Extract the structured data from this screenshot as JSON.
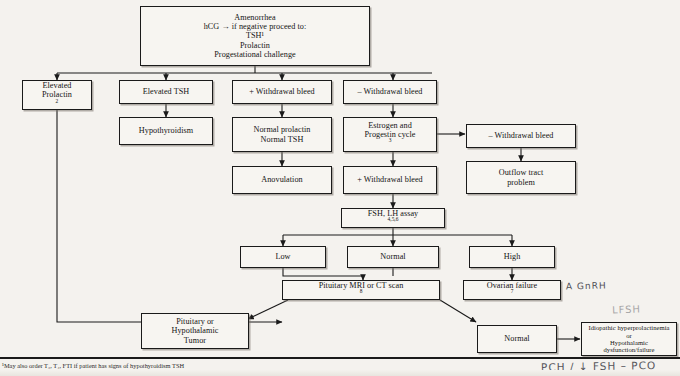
{
  "document": {
    "title": "Amenorrhea diagnostic algorithm flowchart",
    "footnote": "¹May also order T₃, T₄, FTI if patient has signs of hypothyroidism    TSH"
  },
  "nodes": {
    "start": {
      "lines": [
        "Amenorrhea",
        "hCG → if negative proceed to:",
        "TSH¹",
        "Prolactin",
        "Progestational challenge"
      ]
    },
    "elevated_prolactin": {
      "lines": [
        "Elevated",
        "Prolactin"
      ],
      "sup": "2"
    },
    "elevated_tsh": {
      "lines": [
        "Elevated TSH"
      ]
    },
    "hypothyroidism": {
      "lines": [
        "Hypothyroidism"
      ]
    },
    "plus_withdrawal_bleed_1": {
      "lines": [
        "+  Withdrawal bleed"
      ]
    },
    "normal_prolactin_tsh": {
      "lines": [
        "Normal prolactin",
        "Normal TSH"
      ]
    },
    "anovulation": {
      "lines": [
        "Anovulation"
      ]
    },
    "minus_withdrawal_bleed_1": {
      "lines": [
        "–  Withdrawal bleed"
      ]
    },
    "estrogen_progestin": {
      "lines": [
        "Estrogen and",
        "Progestin cycle"
      ],
      "sup": "3"
    },
    "plus_withdrawal_bleed_2": {
      "lines": [
        "+  Withdrawal bleed"
      ]
    },
    "minus_withdrawal_bleed_2": {
      "lines": [
        "–  Withdrawal bleed"
      ]
    },
    "outflow_tract": {
      "lines": [
        "Outflow tract",
        "problem"
      ]
    },
    "fsh_lh_assay": {
      "lines": [
        "FSH, LH assay"
      ],
      "sup": "4,5,6"
    },
    "low": {
      "lines": [
        "Low"
      ]
    },
    "normal_mid": {
      "lines": [
        "Normal"
      ]
    },
    "high": {
      "lines": [
        "High"
      ]
    },
    "ovarian_failure": {
      "lines": [
        "Ovarian failure"
      ],
      "sup": "7"
    },
    "pituitary_mri": {
      "lines": [
        "Pituitary MRI or CT scan"
      ],
      "sup": "8"
    },
    "pituitary_tumor": {
      "lines": [
        "Pituitary or",
        "Hypothalamic",
        "Tumor"
      ]
    },
    "normal_bottom": {
      "lines": [
        "Normal"
      ]
    },
    "idiopathic": {
      "lines": [
        "Idiopathic hyperprolactinemia",
        "or",
        "Hypothalamic dysfunction/failure"
      ]
    }
  },
  "annotations": {
    "gnrh": "A GnRH",
    "faint": "LFSH",
    "pco": "PCH / ↓ FSH – PCO"
  },
  "colors": {
    "ink": "#1a1a1a",
    "paper": "#f4f2ee",
    "box_fill": "#f7f5f1",
    "handwriting": "#2a2a33"
  }
}
